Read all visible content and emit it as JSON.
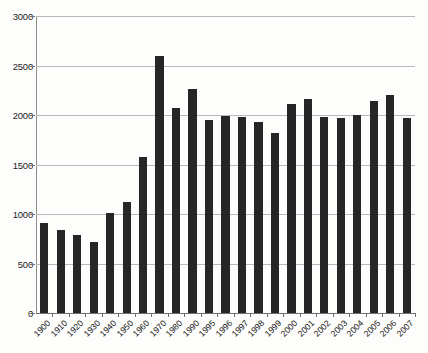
{
  "chart_data": {
    "type": "bar",
    "title": "",
    "subtitle": "",
    "xlabel": "",
    "ylabel": "",
    "ylim": [
      0,
      3000
    ],
    "ytick_interval": 500,
    "yticks": [
      0,
      500,
      1000,
      1500,
      2000,
      2500,
      3000
    ],
    "ytick_labels": [
      "0",
      "500",
      "1000",
      "1500",
      "2000",
      "2500",
      "3000"
    ],
    "grid": true,
    "grid_axis": "y",
    "legend": false,
    "legend_position": "none",
    "bar_color": "#262626",
    "categories": [
      "1900",
      "1910",
      "1920",
      "1930",
      "1940",
      "1950",
      "1960",
      "1970",
      "1980",
      "1990",
      "1995",
      "1996",
      "1997",
      "1998",
      "1999",
      "2000",
      "2001",
      "2002",
      "2003",
      "2004",
      "2005",
      "2006",
      "2007"
    ],
    "values": [
      910,
      840,
      790,
      720,
      1010,
      1120,
      1580,
      2600,
      2070,
      2260,
      1950,
      1990,
      1980,
      1930,
      1820,
      2110,
      2160,
      1975,
      1970,
      2000,
      2140,
      2200,
      1970
    ],
    "series": [
      {
        "name": "",
        "values": [
          910,
          840,
          790,
          720,
          1010,
          1120,
          1580,
          2600,
          2070,
          2260,
          1950,
          1990,
          1980,
          1930,
          1820,
          2110,
          2160,
          1975,
          1970,
          2000,
          2140,
          2200,
          1970
        ]
      }
    ]
  },
  "axes": {
    "y_tick_labels": [
      "3000",
      "2500",
      "2000",
      "1500",
      "1000",
      "500",
      "0"
    ],
    "x_tick_labels": [
      "1900",
      "1910",
      "1920",
      "1930",
      "1940",
      "1950",
      "1960",
      "1970",
      "1980",
      "1990",
      "1995",
      "1996",
      "1997",
      "1998",
      "1999",
      "2000",
      "2001",
      "2002",
      "2003",
      "2004",
      "2005",
      "2006",
      "2007"
    ]
  }
}
